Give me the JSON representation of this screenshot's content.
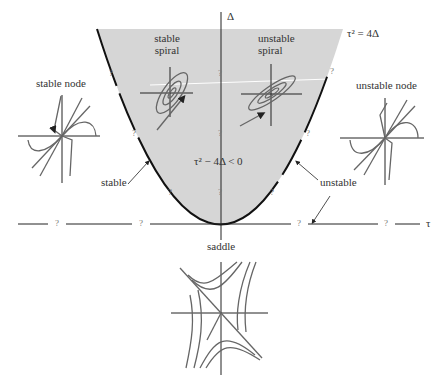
{
  "axes": {
    "vertical": "Δ",
    "horizontal": "τ"
  },
  "boundary_label": "τ² = 4Δ",
  "region_label": "τ² − 4Δ  < 0",
  "regions": {
    "stable_spiral": [
      "stable",
      "spiral"
    ],
    "unstable_spiral": [
      "unstable",
      "spiral"
    ],
    "stable_node": "stable node",
    "unstable_node": "unstable node",
    "saddle": "saddle"
  },
  "annotations": {
    "stable": "stable",
    "unstable": "unstable"
  },
  "unknown_marker": "?",
  "colors": {
    "shade": "#d6d6d6",
    "line": "#222222",
    "curve": "#666666"
  }
}
